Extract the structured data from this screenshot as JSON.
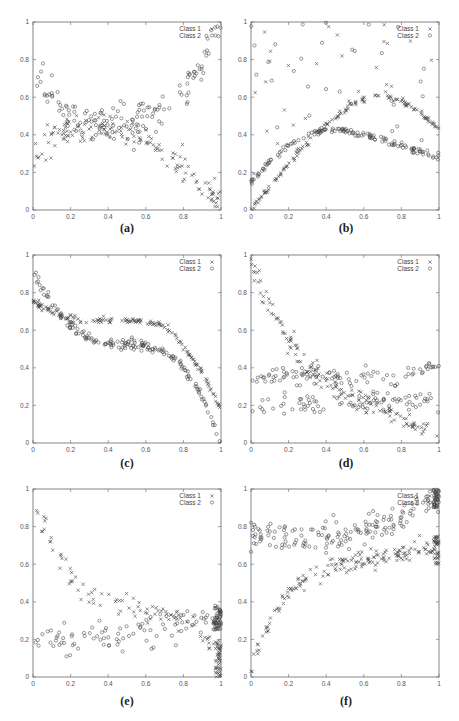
{
  "figure": {
    "panels": [
      {
        "id": "a",
        "caption": "(a)"
      },
      {
        "id": "b",
        "caption": "(b)"
      },
      {
        "id": "c",
        "caption": "(c)"
      },
      {
        "id": "d",
        "caption": "(d)"
      },
      {
        "id": "e",
        "caption": "(e)"
      },
      {
        "id": "f",
        "caption": "(f)"
      }
    ]
  },
  "chart_data": [
    {
      "panel": "a",
      "type": "scatter",
      "title": "",
      "xlabel": "",
      "ylabel": "",
      "xlim": [
        0,
        1
      ],
      "ylim": [
        0,
        1
      ],
      "xticks": [
        "0",
        "0.2",
        "0.4",
        "0.6",
        "0.8",
        "1"
      ],
      "yticks": [
        "0",
        "0.2",
        "0.4",
        "0.6",
        "0.8",
        "1"
      ],
      "grid": false,
      "legend_position": "top-right",
      "legend": [
        "Class 1",
        "Class 2"
      ],
      "series": [
        {
          "name": "Class 1",
          "marker": "x",
          "description": "rises from ~0.3 at x=0 to ~0.45 at x=0.2, flat ~0.42 until x=0.6, then falls to ~0.0 at x=1",
          "curve": [
            [
              0,
              0.3
            ],
            [
              0.1,
              0.38
            ],
            [
              0.2,
              0.44
            ],
            [
              0.4,
              0.42
            ],
            [
              0.6,
              0.38
            ],
            [
              0.7,
              0.32
            ],
            [
              0.8,
              0.24
            ],
            [
              0.9,
              0.14
            ],
            [
              1.0,
              0.02
            ]
          ],
          "noise": 0.04,
          "n": 140
        },
        {
          "name": "Class 2",
          "marker": "o",
          "description": "falls from ~0.75 at x=0 to ~0.45 at x=0.2, flat ~0.42 to x=0.5, then rises to ~0.95 at x=1",
          "curve": [
            [
              0,
              0.72
            ],
            [
              0.1,
              0.58
            ],
            [
              0.2,
              0.5
            ],
            [
              0.4,
              0.44
            ],
            [
              0.55,
              0.45
            ],
            [
              0.7,
              0.55
            ],
            [
              0.8,
              0.65
            ],
            [
              0.9,
              0.78
            ],
            [
              1.0,
              0.95
            ]
          ],
          "noise": 0.05,
          "n": 150
        }
      ]
    },
    {
      "panel": "b",
      "type": "scatter",
      "title": "",
      "xlabel": "",
      "ylabel": "",
      "xlim": [
        0,
        1
      ],
      "ylim": [
        0,
        1
      ],
      "xticks": [
        "0",
        "0.2",
        "0.4",
        "0.6",
        "0.8",
        "1"
      ],
      "yticks": [
        "0",
        "0.2",
        "0.4",
        "0.6",
        "0.8",
        "1"
      ],
      "grid": false,
      "legend_position": "top-right",
      "legend": [
        "Class 1",
        "Class 2"
      ],
      "series": [
        {
          "name": "Class 1",
          "marker": "x",
          "description": "arch from 0 at x=0 peaking ~0.61 near x=0.7, down to ~0.45 at x=1; scattered outliers up to 1",
          "curve": [
            [
              0,
              0.0
            ],
            [
              0.1,
              0.12
            ],
            [
              0.2,
              0.25
            ],
            [
              0.3,
              0.36
            ],
            [
              0.4,
              0.45
            ],
            [
              0.5,
              0.54
            ],
            [
              0.6,
              0.59
            ],
            [
              0.7,
              0.61
            ],
            [
              0.8,
              0.58
            ],
            [
              0.9,
              0.52
            ],
            [
              1.0,
              0.43
            ]
          ],
          "noise": 0.008,
          "n": 140,
          "outliers": 30
        },
        {
          "name": "Class 2",
          "marker": "o",
          "description": "arch from ~0.15 at x=0 peaking ~0.43 near x=0.4, down to ~0.28 at x=1; scattered outliers",
          "curve": [
            [
              0,
              0.14
            ],
            [
              0.1,
              0.26
            ],
            [
              0.2,
              0.34
            ],
            [
              0.3,
              0.4
            ],
            [
              0.4,
              0.43
            ],
            [
              0.5,
              0.42
            ],
            [
              0.6,
              0.4
            ],
            [
              0.7,
              0.37
            ],
            [
              0.8,
              0.34
            ],
            [
              0.9,
              0.31
            ],
            [
              1.0,
              0.28
            ]
          ],
          "noise": 0.008,
          "n": 140,
          "outliers": 30
        }
      ]
    },
    {
      "panel": "c",
      "type": "scatter",
      "title": "",
      "xlabel": "",
      "ylabel": "",
      "xlim": [
        0,
        1
      ],
      "ylim": [
        0,
        1
      ],
      "xticks": [
        "0",
        "0.2",
        "0.4",
        "0.6",
        "0.8",
        "1"
      ],
      "yticks": [
        "0",
        "0.2",
        "0.4",
        "0.6",
        "0.8",
        "1"
      ],
      "grid": false,
      "legend_position": "top-right",
      "legend": [
        "Class 1",
        "Class 2"
      ],
      "series": [
        {
          "name": "Class 1",
          "marker": "x",
          "description": "falls from ~0.75 to ~0.66 at x=0.2, plateau ~0.65 to x=0.65, then drops to ~0.2 at x=1",
          "curve": [
            [
              0,
              0.75
            ],
            [
              0.1,
              0.7
            ],
            [
              0.2,
              0.66
            ],
            [
              0.4,
              0.65
            ],
            [
              0.6,
              0.65
            ],
            [
              0.7,
              0.62
            ],
            [
              0.8,
              0.52
            ],
            [
              0.9,
              0.38
            ],
            [
              1.0,
              0.18
            ]
          ],
          "noise": 0.01,
          "n": 160
        },
        {
          "name": "Class 2",
          "marker": "o",
          "description": "falls from ~0.95 at x=0 to ~0.55 at x=0.3, plateau ~0.53 to x=0.65, then drops to 0 at x=1",
          "curve": [
            [
              0,
              0.92
            ],
            [
              0.05,
              0.82
            ],
            [
              0.1,
              0.74
            ],
            [
              0.2,
              0.62
            ],
            [
              0.3,
              0.55
            ],
            [
              0.4,
              0.53
            ],
            [
              0.6,
              0.52
            ],
            [
              0.7,
              0.49
            ],
            [
              0.8,
              0.4
            ],
            [
              0.9,
              0.25
            ],
            [
              1.0,
              0.0
            ]
          ],
          "noise": 0.012,
          "n": 170
        }
      ]
    },
    {
      "panel": "d",
      "type": "scatter",
      "title": "",
      "xlabel": "",
      "ylabel": "",
      "xlim": [
        0,
        1
      ],
      "ylim": [
        0,
        1
      ],
      "xticks": [
        "0",
        "0.2",
        "0.4",
        "0.6",
        "0.8",
        "1"
      ],
      "yticks": [
        "0",
        "0.2",
        "0.4",
        "0.6",
        "0.8",
        "1"
      ],
      "grid": false,
      "legend_position": "top-right",
      "legend": [
        "Class 1",
        "Class 2"
      ],
      "series": [
        {
          "name": "Class 1",
          "marker": "x",
          "description": "steep decay from ~0.95 at x=0 to ~0.35 at x=0.3, then gradual decline to ~0.02 at x=1",
          "curve": [
            [
              0,
              0.95
            ],
            [
              0.1,
              0.72
            ],
            [
              0.2,
              0.55
            ],
            [
              0.3,
              0.4
            ],
            [
              0.4,
              0.32
            ],
            [
              0.5,
              0.27
            ],
            [
              0.6,
              0.22
            ],
            [
              0.7,
              0.18
            ],
            [
              0.8,
              0.14
            ],
            [
              0.9,
              0.08
            ],
            [
              1.0,
              0.02
            ]
          ],
          "noise": 0.03,
          "n": 150
        },
        {
          "name": "Class 2",
          "marker": "o",
          "description": "two bands: ~0.35 rising to 0.42 and ~0.2 flat; broad scatter between 0.18 and 0.45",
          "curve": [
            [
              0,
              0.34
            ],
            [
              0.2,
              0.36
            ],
            [
              0.4,
              0.36
            ],
            [
              0.6,
              0.35
            ],
            [
              0.8,
              0.35
            ],
            [
              1.0,
              0.42
            ]
          ],
          "curve2": [
            [
              0,
              0.19
            ],
            [
              0.3,
              0.21
            ],
            [
              0.5,
              0.21
            ],
            [
              0.7,
              0.22
            ],
            [
              1.0,
              0.22
            ]
          ],
          "noise": 0.03,
          "n": 180
        }
      ]
    },
    {
      "panel": "e",
      "type": "scatter",
      "title": "",
      "xlabel": "",
      "ylabel": "",
      "xlim": [
        0,
        1
      ],
      "ylim": [
        0,
        1
      ],
      "xticks": [
        "0",
        "0.2",
        "0.4",
        "0.6",
        "0.8",
        "1"
      ],
      "yticks": [
        "0",
        "0.2",
        "0.4",
        "0.6",
        "0.8",
        "1"
      ],
      "grid": false,
      "legend_position": "top-right",
      "legend": [
        "Class 1",
        "Class 2"
      ],
      "series": [
        {
          "name": "Class 1",
          "marker": "x",
          "description": "sparse decay from ~0.95 at x=0 to ~0.35 around x=0.5, then ~0.3 declining to ~0.05 dense cluster at x=1",
          "curve": [
            [
              0,
              0.95
            ],
            [
              0.05,
              0.8
            ],
            [
              0.1,
              0.72
            ],
            [
              0.2,
              0.55
            ],
            [
              0.3,
              0.42
            ],
            [
              0.5,
              0.36
            ],
            [
              0.7,
              0.34
            ],
            [
              0.85,
              0.28
            ],
            [
              0.95,
              0.18
            ],
            [
              1.0,
              0.06
            ]
          ],
          "noise": 0.03,
          "n": 90,
          "dense_end": [
            0.97,
            1.0,
            0.0,
            0.2,
            45
          ]
        },
        {
          "name": "Class 2",
          "marker": "o",
          "description": "sparse ~0.2 at x=0 rising to ~0.3 at x=1, dense cluster 0.25-0.38 at x=1",
          "curve": [
            [
              0,
              0.18
            ],
            [
              0.2,
              0.2
            ],
            [
              0.4,
              0.22
            ],
            [
              0.6,
              0.24
            ],
            [
              0.8,
              0.27
            ],
            [
              1.0,
              0.32
            ]
          ],
          "noise": 0.04,
          "n": 90,
          "dense_end": [
            0.96,
            1.0,
            0.25,
            0.38,
            50
          ]
        }
      ]
    },
    {
      "panel": "f",
      "type": "scatter",
      "title": "",
      "xlabel": "",
      "ylabel": "",
      "xlim": [
        0,
        1
      ],
      "ylim": [
        0,
        1
      ],
      "xticks": [
        "0",
        "0.2",
        "0.4",
        "0.6",
        "0.8",
        "1"
      ],
      "yticks": [
        "0",
        "0.2",
        "0.4",
        "0.6",
        "0.8",
        "1"
      ],
      "grid": false,
      "legend_position": "top-right",
      "legend": [
        "Class 1",
        "Class 2"
      ],
      "series": [
        {
          "name": "Class 1",
          "marker": "x",
          "description": "concave rise from ~0 at x=0 to ~0.45 at x=0.2, ~0.6 at x=0.5, ~0.7 at x=1",
          "curve": [
            [
              0,
              0.02
            ],
            [
              0.05,
              0.18
            ],
            [
              0.1,
              0.3
            ],
            [
              0.2,
              0.45
            ],
            [
              0.3,
              0.53
            ],
            [
              0.4,
              0.57
            ],
            [
              0.5,
              0.6
            ],
            [
              0.6,
              0.62
            ],
            [
              0.7,
              0.64
            ],
            [
              0.8,
              0.66
            ],
            [
              0.9,
              0.68
            ],
            [
              1.0,
              0.7
            ]
          ],
          "noise": 0.025,
          "n": 160,
          "dense_end": [
            0.97,
            1.0,
            0.6,
            0.75,
            40
          ]
        },
        {
          "name": "Class 2",
          "marker": "o",
          "description": "roughly flat ~0.75 from x=0 to 0.5, rising to ~0.97 at x=1",
          "curve": [
            [
              0,
              0.75
            ],
            [
              0.2,
              0.74
            ],
            [
              0.4,
              0.74
            ],
            [
              0.5,
              0.75
            ],
            [
              0.6,
              0.78
            ],
            [
              0.7,
              0.8
            ],
            [
              0.8,
              0.84
            ],
            [
              0.9,
              0.9
            ],
            [
              1.0,
              0.96
            ]
          ],
          "noise": 0.04,
          "n": 160,
          "dense_end": [
            0.97,
            1.0,
            0.9,
            1.0,
            40
          ]
        }
      ]
    }
  ]
}
